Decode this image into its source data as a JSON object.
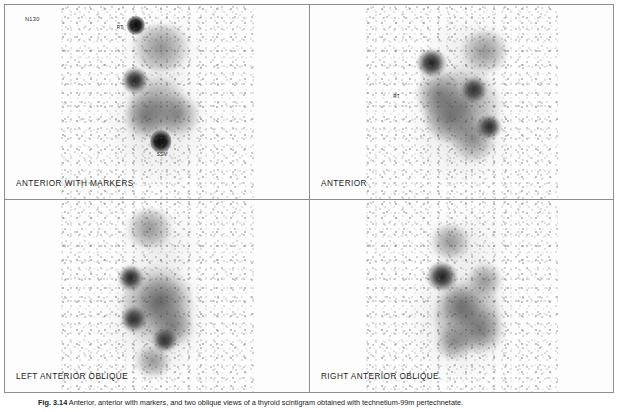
{
  "figure": {
    "legend_number": "Fig. 3.14",
    "legend_text": "Anterior, anterior with markers, and two oblique views of a thyroid scintigram obtained with technetium-99m pertechnetate."
  },
  "panels": [
    {
      "id": "anterior-with-markers",
      "caption": "ANTERIOR WITH MARKERS",
      "study_id": "N130",
      "markers": [
        {
          "label": "RT",
          "x": 31.0,
          "y": 11.5
        },
        {
          "label": "SSN",
          "x": 52.5,
          "y": 77.0
        }
      ],
      "hotspots": [
        {
          "kind": "marker",
          "x": 39.0,
          "y": 10.5,
          "w": 9.5,
          "h": 9.5
        },
        {
          "kind": "marker",
          "x": 52.0,
          "y": 70.5,
          "w": 11.0,
          "h": 11.5
        },
        {
          "kind": "focal",
          "x": 38.5,
          "y": 39.0,
          "w": 13.0,
          "h": 13.0
        },
        {
          "kind": "diffuse",
          "x": 50.0,
          "y": 52.0,
          "w": 30.0,
          "h": 34.0
        },
        {
          "kind": "diffuse",
          "x": 61.0,
          "y": 57.0,
          "w": 22.0,
          "h": 22.0
        },
        {
          "kind": "diffuse",
          "x": 44.0,
          "y": 58.0,
          "w": 20.0,
          "h": 24.0
        },
        {
          "kind": "diffuse",
          "x": 52.0,
          "y": 22.0,
          "w": 34.0,
          "h": 24.0
        }
      ]
    },
    {
      "id": "anterior",
      "caption": "ANTERIOR",
      "study_id": "",
      "markers": [
        {
          "label": "RT",
          "x": 16.5,
          "y": 47.0
        }
      ],
      "hotspots": [
        {
          "kind": "focal",
          "x": 34.5,
          "y": 30.0,
          "w": 15.0,
          "h": 14.0
        },
        {
          "kind": "focal",
          "x": 56.5,
          "y": 44.0,
          "w": 13.0,
          "h": 13.0
        },
        {
          "kind": "focal",
          "x": 64.0,
          "y": 63.0,
          "w": 13.0,
          "h": 12.0
        },
        {
          "kind": "diffuse",
          "x": 50.0,
          "y": 52.0,
          "w": 40.0,
          "h": 42.0
        },
        {
          "kind": "diffuse",
          "x": 44.0,
          "y": 58.0,
          "w": 26.0,
          "h": 28.0
        },
        {
          "kind": "diffuse",
          "x": 56.0,
          "y": 70.0,
          "w": 24.0,
          "h": 22.0
        },
        {
          "kind": "diffuse",
          "x": 62.0,
          "y": 24.0,
          "w": 26.0,
          "h": 22.0
        },
        {
          "kind": "diffuse",
          "x": 38.0,
          "y": 46.0,
          "w": 22.0,
          "h": 26.0
        }
      ]
    },
    {
      "id": "left-anterior-oblique",
      "caption": "LEFT ANTERIOR OBLIQUE",
      "study_id": "",
      "markers": [],
      "hotspots": [
        {
          "kind": "focal",
          "x": 36.5,
          "y": 41.0,
          "w": 13.0,
          "h": 13.0
        },
        {
          "kind": "focal",
          "x": 38.0,
          "y": 62.0,
          "w": 13.0,
          "h": 13.0
        },
        {
          "kind": "focal",
          "x": 54.0,
          "y": 73.0,
          "w": 13.0,
          "h": 12.0
        },
        {
          "kind": "diffuse",
          "x": 50.0,
          "y": 55.0,
          "w": 36.0,
          "h": 46.0
        },
        {
          "kind": "diffuse",
          "x": 52.0,
          "y": 52.0,
          "w": 24.0,
          "h": 26.0
        },
        {
          "kind": "diffuse",
          "x": 58.0,
          "y": 66.0,
          "w": 22.0,
          "h": 22.0
        },
        {
          "kind": "diffuse",
          "x": 46.0,
          "y": 15.0,
          "w": 26.0,
          "h": 20.0
        },
        {
          "kind": "diffuse",
          "x": 48.0,
          "y": 84.0,
          "w": 20.0,
          "h": 16.0
        }
      ]
    },
    {
      "id": "right-anterior-oblique",
      "caption": "RIGHT ANTERIOR OBLIQUE",
      "study_id": "",
      "markers": [],
      "hotspots": [
        {
          "kind": "focal",
          "x": 40.0,
          "y": 40.0,
          "w": 16.0,
          "h": 15.0
        },
        {
          "kind": "diffuse",
          "x": 53.0,
          "y": 60.0,
          "w": 34.0,
          "h": 42.0
        },
        {
          "kind": "diffuse",
          "x": 50.0,
          "y": 55.0,
          "w": 20.0,
          "h": 22.0
        },
        {
          "kind": "diffuse",
          "x": 60.0,
          "y": 68.0,
          "w": 24.0,
          "h": 24.0
        },
        {
          "kind": "diffuse",
          "x": 62.0,
          "y": 42.0,
          "w": 18.0,
          "h": 18.0
        },
        {
          "kind": "diffuse",
          "x": 46.0,
          "y": 74.0,
          "w": 20.0,
          "h": 18.0
        },
        {
          "kind": "diffuse",
          "x": 44.0,
          "y": 22.0,
          "w": 22.0,
          "h": 18.0
        }
      ]
    }
  ]
}
